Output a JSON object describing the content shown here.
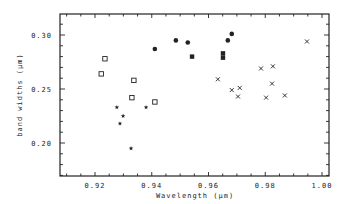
{
  "chart_data": {
    "type": "scatter",
    "title": "",
    "xlabel": "Wavelength (µm)",
    "ylabel": "band widths (µm)",
    "xlim": [
      0.91,
      1.0
    ],
    "ylim": [
      0.17,
      0.32
    ],
    "grid": false,
    "legend": null,
    "x_ticks": [
      0.92,
      0.94,
      0.96,
      0.98,
      1.0
    ],
    "x_tick_labels": [
      "0.92",
      "0.94",
      "0.96",
      "0.98",
      "1.00"
    ],
    "y_ticks": [
      0.2,
      0.25,
      0.3
    ],
    "y_tick_labels": [
      "0.20",
      "0.25",
      "0.30"
    ],
    "series": [
      {
        "name": "open-square",
        "marker": "open-square",
        "points": [
          [
            0.9235,
            0.278
          ],
          [
            0.9222,
            0.264
          ],
          [
            0.9337,
            0.258
          ],
          [
            0.933,
            0.242
          ],
          [
            0.9411,
            0.238
          ]
        ]
      },
      {
        "name": "star",
        "marker": "star",
        "points": [
          [
            0.9277,
            0.233
          ],
          [
            0.9299,
            0.225
          ],
          [
            0.9288,
            0.218
          ],
          [
            0.938,
            0.233
          ],
          [
            0.9327,
            0.195
          ]
        ]
      },
      {
        "name": "filled-circle",
        "marker": "filled-circle",
        "points": [
          [
            0.9411,
            0.287
          ],
          [
            0.9485,
            0.295
          ],
          [
            0.9527,
            0.293
          ],
          [
            0.9668,
            0.295
          ],
          [
            0.9682,
            0.301
          ]
        ]
      },
      {
        "name": "filled-square",
        "marker": "filled-square",
        "points": [
          [
            0.9542,
            0.28
          ],
          [
            0.9651,
            0.283
          ],
          [
            0.9651,
            0.279
          ]
        ]
      },
      {
        "name": "x-mark",
        "marker": "x",
        "points": [
          [
            0.9633,
            0.259
          ],
          [
            0.9682,
            0.249
          ],
          [
            0.971,
            0.251
          ],
          [
            0.9704,
            0.243
          ],
          [
            0.9785,
            0.269
          ],
          [
            0.9827,
            0.271
          ],
          [
            0.9824,
            0.255
          ],
          [
            0.9803,
            0.242
          ],
          [
            0.9869,
            0.244
          ],
          [
            0.9947,
            0.294
          ]
        ]
      }
    ]
  },
  "layout": {
    "plot": {
      "left": 60,
      "right": 329,
      "top": 14,
      "bottom": 176
    },
    "x_map": {
      "v0": 0.92,
      "px0": 95,
      "v1": 1.0,
      "px1": 322
    },
    "y_map": {
      "v0": 0.3,
      "px0": 35,
      "v1": 0.2,
      "px1": 143
    }
  }
}
